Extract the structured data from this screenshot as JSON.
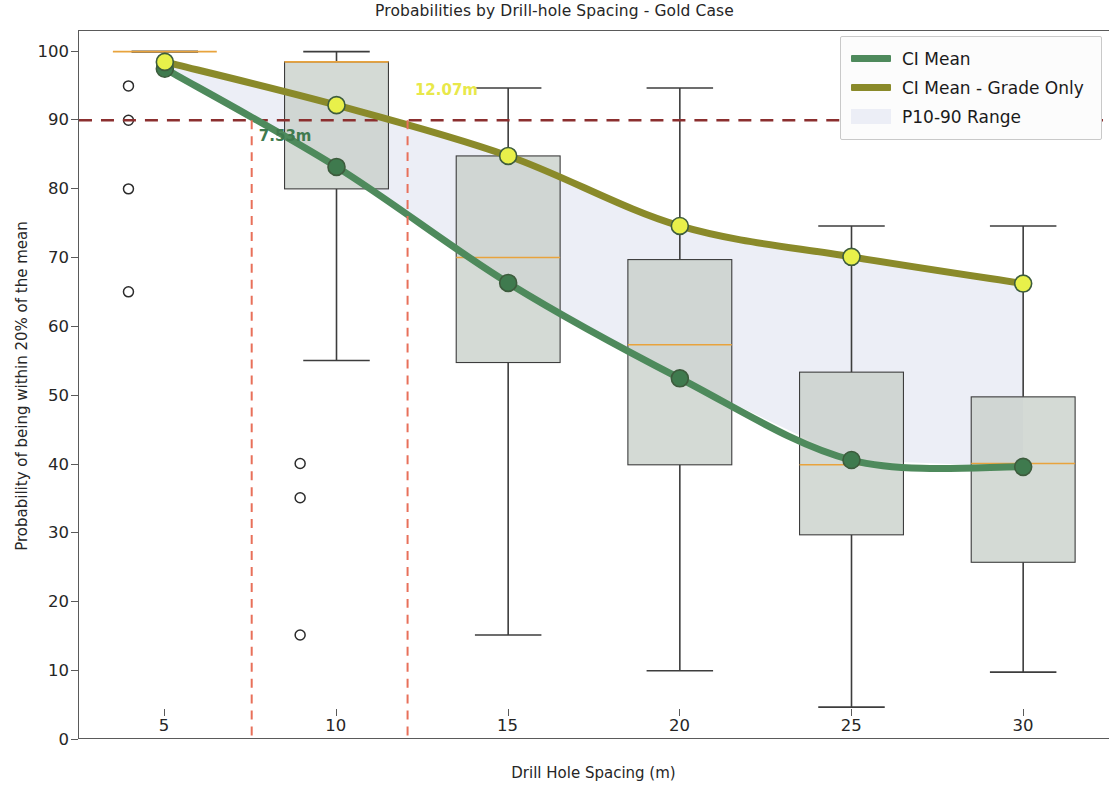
{
  "chart_data": {
    "type": "line",
    "title": "Probabilities by Drill-hole Spacing - Gold Case",
    "xlabel": "Drill Hole Spacing (m)",
    "ylabel": "Probability of being within 20% of the mean",
    "x": [
      5,
      10,
      15,
      20,
      25,
      30
    ],
    "xticks": [
      5,
      10,
      15,
      20,
      25,
      30
    ],
    "yticks": [
      0,
      10,
      20,
      30,
      40,
      50,
      60,
      70,
      80,
      90,
      100
    ],
    "xlim": [
      2.5,
      32.5
    ],
    "ylim": [
      0,
      103
    ],
    "grid": false,
    "legend_position": "upper right",
    "series": [
      {
        "name": "CI Mean",
        "color": "#4e8a5c",
        "marker_color": "#3f7a4e",
        "values": [
          97.5,
          83.2,
          66.3,
          52.4,
          40.5,
          39.5
        ]
      },
      {
        "name": "CI Mean - Grade Only",
        "color": "#8a8a2a",
        "marker_color": "#e8f04a",
        "values": [
          98.5,
          92.2,
          84.8,
          74.6,
          70.1,
          66.2
        ]
      }
    ],
    "band": {
      "name": "P10-90 Range",
      "color": "#eceef6",
      "lower": [
        97.5,
        83.2,
        66.3,
        52.4,
        40.5,
        39.5
      ],
      "upper": [
        98.5,
        92.2,
        84.8,
        74.6,
        70.1,
        66.2
      ]
    },
    "boxplots": [
      {
        "x": 5,
        "whisker_low": 100.0,
        "q1": 100.0,
        "median": 100.0,
        "q3": 100.0,
        "whisker_high": 100.0,
        "outliers": [
          95.0,
          90.0,
          80.0,
          65.0
        ]
      },
      {
        "x": 10,
        "whisker_low": 55.0,
        "q1": 80.0,
        "median": 98.5,
        "q3": 98.5,
        "whisker_high": 100.0,
        "outliers": [
          40.0,
          35.0,
          15.0
        ]
      },
      {
        "x": 15,
        "whisker_low": 15.0,
        "q1": 54.7,
        "median": 70.0,
        "q3": 84.8,
        "whisker_high": 94.7,
        "outliers": []
      },
      {
        "x": 20,
        "whisker_low": 9.8,
        "q1": 39.8,
        "median": 57.3,
        "q3": 69.7,
        "whisker_high": 94.7,
        "outliers": []
      },
      {
        "x": 25,
        "whisker_low": 4.5,
        "q1": 29.6,
        "median": 39.8,
        "q3": 53.3,
        "whisker_high": 74.6,
        "outliers": []
      },
      {
        "x": 30,
        "whisker_low": 9.6,
        "q1": 25.6,
        "median": 40.0,
        "q3": 49.7,
        "whisker_high": 74.6,
        "outliers": []
      }
    ],
    "box_fill": "#c8cfc9",
    "box_edge": "#3d3d3d",
    "median_color": "#e8a33d",
    "threshold_line": {
      "value": 90,
      "label": "90",
      "color": "#8b2f2f",
      "style": "dashed"
    },
    "vertical_markers": [
      {
        "x": 7.53,
        "label": "7.53m",
        "color": "#3f7a4e",
        "line_color": "#e8705a"
      },
      {
        "x": 12.07,
        "label": "12.07m",
        "color": "#e8e84a",
        "line_color": "#e8705a"
      }
    ]
  }
}
